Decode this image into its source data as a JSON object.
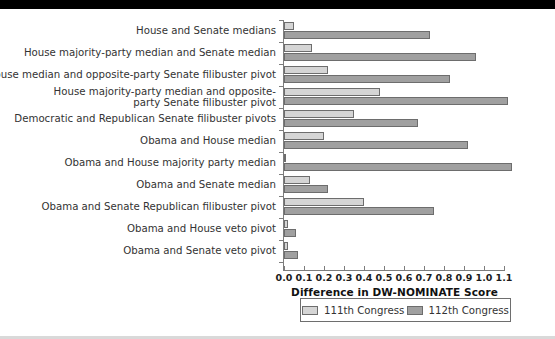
{
  "figure": {
    "top_band": "black-header-band",
    "bottom_rule": "gray-footer-rule"
  },
  "legend": {
    "position": "bottom-center",
    "entries": [
      {
        "label": "111th Congress",
        "color": "#d5d5d5"
      },
      {
        "label": "112th Congress",
        "color": "#a0a0a0"
      }
    ]
  },
  "axis": {
    "x_title": "Difference in DW-NOMINATE Score",
    "x_ticks": [
      "0.0",
      "0.1",
      "0.2",
      "0.3",
      "0.4",
      "0.5",
      "0.6",
      "0.7",
      "0.8",
      "0.9",
      "1.0",
      "1.1"
    ]
  },
  "chart_data": {
    "type": "bar",
    "orientation": "horizontal",
    "title": "",
    "xlabel": "Difference in DW-NOMINATE Score",
    "ylabel": "",
    "xlim": [
      0.0,
      1.1
    ],
    "grid": false,
    "legend_position": "bottom-center",
    "categories": [
      "House and Senate medians",
      "House majority-party median and Senate median",
      "House median and opposite-party Senate filibuster pivot",
      "House majority-party median and opposite-party Senate filibuster pivot",
      "Democratic and Republican Senate filibuster pivots",
      "Obama and House median",
      "Obama and House majority party median",
      "Obama and Senate median",
      "Obama and Senate Republican filibuster pivot",
      "Obama and House veto pivot",
      "Obama and Senate veto pivot"
    ],
    "category_lines": [
      [
        "House and Senate medians"
      ],
      [
        "House majority-party median and Senate median"
      ],
      [
        "House median and opposite-party Senate filibuster pivot"
      ],
      [
        "House majority-party median and opposite-",
        "party Senate filibuster pivot"
      ],
      [
        "Democratic and Republican Senate filibuster pivots"
      ],
      [
        "Obama and House median"
      ],
      [
        "Obama and House majority party median"
      ],
      [
        "Obama and Senate median"
      ],
      [
        "Obama and Senate Republican filibuster pivot"
      ],
      [
        "Obama and House veto pivot"
      ],
      [
        "Obama and Senate veto pivot"
      ]
    ],
    "series": [
      {
        "name": "111th Congress",
        "color": "#d5d5d5",
        "values": [
          0.05,
          0.14,
          0.22,
          0.48,
          0.35,
          0.2,
          0.01,
          0.13,
          0.4,
          0.02,
          0.02
        ]
      },
      {
        "name": "112th Congress",
        "color": "#a0a0a0",
        "values": [
          0.73,
          0.96,
          0.83,
          1.12,
          0.67,
          0.92,
          1.14,
          0.22,
          0.75,
          0.06,
          0.07
        ]
      }
    ]
  }
}
